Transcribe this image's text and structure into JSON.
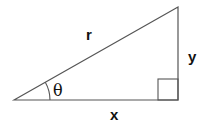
{
  "diagram": {
    "type": "right-triangle",
    "labels": {
      "hypotenuse": "r",
      "opposite": "y",
      "adjacent": "x",
      "angle": "θ"
    },
    "colors": {
      "stroke": "#555555",
      "text": "#111111",
      "background": "#ffffff"
    }
  }
}
